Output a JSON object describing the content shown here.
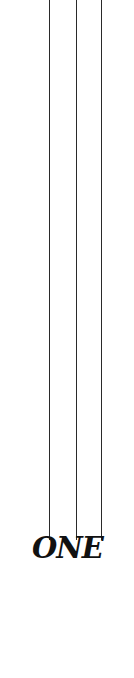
{
  "page": {
    "title": "ONE",
    "background": "#ffffff",
    "ink_color": "#111111"
  },
  "decoration": {
    "lines": [
      {
        "x": 49,
        "top": 0,
        "bottom": 540
      },
      {
        "x": 76,
        "top": 0,
        "bottom": 540
      },
      {
        "x": 101,
        "top": 0,
        "bottom": 540
      }
    ]
  }
}
